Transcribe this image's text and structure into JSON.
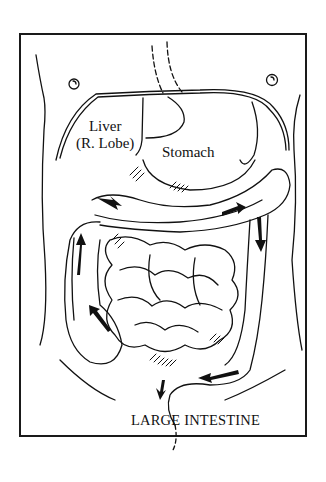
{
  "figure": {
    "type": "anatomical-illustration",
    "labels": {
      "liver_line1": "Liver",
      "liver_line2": "(R. Lobe)",
      "stomach": "Stomach",
      "large_intestine": "LARGE INTESTINE"
    },
    "colors": {
      "ink": "#111111",
      "background": "#ffffff"
    },
    "arrows_count": 7
  }
}
